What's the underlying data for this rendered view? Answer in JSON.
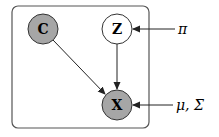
{
  "diagram": {
    "type": "graphical-model",
    "plate": {
      "x": 12,
      "y": 6,
      "width": 137,
      "height": 122,
      "rx": 6,
      "stroke": "#555555"
    },
    "colors": {
      "observed_fill": "#a6a6a6",
      "latent_fill": "#ffffff",
      "stroke": "#333333",
      "arrow": "#222222"
    },
    "nodes": [
      {
        "id": "C",
        "label": "C",
        "cx": 43,
        "cy": 29,
        "r": 15,
        "observed": true
      },
      {
        "id": "Z",
        "label": "Z",
        "cx": 117,
        "cy": 29,
        "r": 15,
        "observed": false
      },
      {
        "id": "X",
        "label": "X",
        "cx": 117,
        "cy": 105,
        "r": 15,
        "observed": true
      }
    ],
    "external_params": [
      {
        "id": "pi",
        "label": "π",
        "x": 178,
        "y": 34
      },
      {
        "id": "mu_sigma",
        "label": "μ, Σ",
        "x": 176,
        "y": 110
      }
    ],
    "edges": [
      {
        "from": "C",
        "to": "X"
      },
      {
        "from": "Z",
        "to": "X"
      },
      {
        "from": "pi",
        "to": "Z"
      },
      {
        "from": "mu_sigma",
        "to": "X"
      }
    ]
  }
}
